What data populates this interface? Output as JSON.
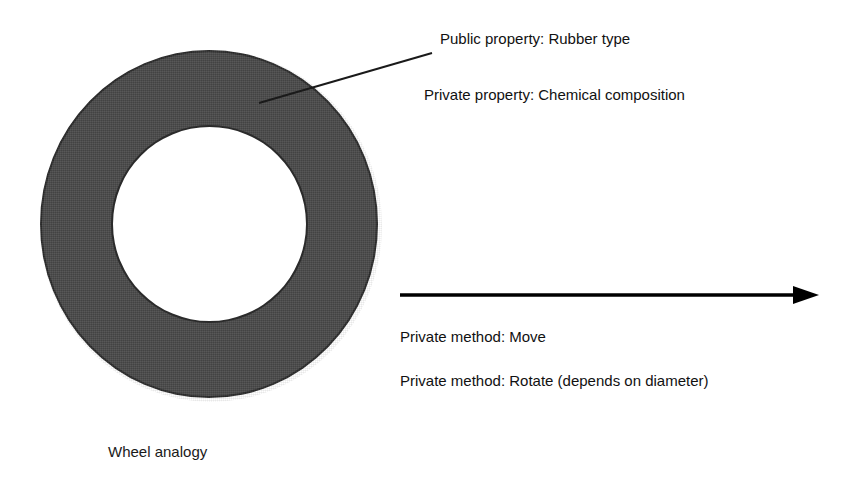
{
  "diagram": {
    "title": "Wheel analogy",
    "background_color": "#ffffff",
    "wheel": {
      "name": "wheel-annulus",
      "ring_color": "#4a4a4a",
      "outline_color": "#2b2b2b",
      "hole_color": "#ffffff",
      "caption": "Wheel analogy"
    },
    "leader_line": {
      "name": "leader-line",
      "color": "#1a1a1a",
      "from_x": 259,
      "from_y": 103,
      "to_x": 432,
      "to_y": 53
    },
    "motion_arrow": {
      "name": "motion-arrow",
      "color": "#000000",
      "from_x": 400,
      "from_y": 295,
      "to_x": 819,
      "to_y": 295
    },
    "labels": [
      {
        "id": "public-property",
        "text": "Public property: Rubber type"
      },
      {
        "id": "private-property",
        "text": "Private property: Chemical composition"
      },
      {
        "id": "private-move",
        "text": "Private method: Move"
      },
      {
        "id": "private-rotate",
        "text": "Private method: Rotate (depends on diameter)"
      }
    ]
  }
}
